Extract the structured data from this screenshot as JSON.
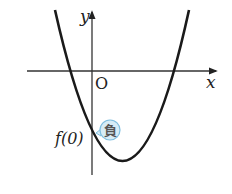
{
  "diagram": {
    "type": "parabola-graph",
    "axes": {
      "x_label": "x",
      "y_label": "y",
      "origin_label": "O"
    },
    "curve": {
      "description": "upward-opening parabola with two x-intercepts, one negative and one positive, vertex below x-axis to the right of the y-axis",
      "color": "#1a1a1a"
    },
    "annotation": {
      "point_label": "f(0)",
      "badge_text": "負",
      "badge_fill": "#d6ecf7",
      "badge_stroke": "#7fbfe0"
    }
  }
}
